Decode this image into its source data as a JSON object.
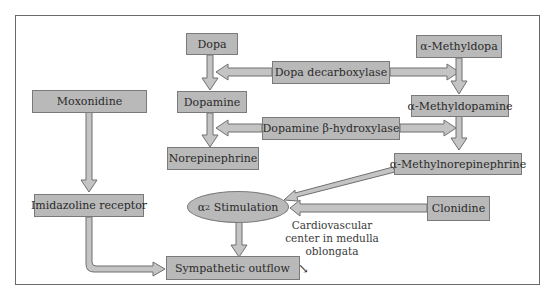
{
  "diagram": {
    "nodes": {
      "dopa": "Dopa",
      "dopamine": "Dopamine",
      "norepinephrine": "Norepinephrine",
      "alpha_methyldopa": "α-Methyldopa",
      "alpha_methyldopamine": "α-Methyldopamine",
      "alpha_methylnorepinephrine": "α-Methylnorepinephrine",
      "dopa_decarboxylase": "Dopa decarboxylase",
      "dopamine_beta_hydroxylase": "Dopamine β-hydroxylase",
      "moxonidine": "Moxonidine",
      "imidazoline_receptor": "Imidazoline receptor",
      "alpha2_stimulation_prefix": "α",
      "alpha2_stimulation_sub": "2",
      "alpha2_stimulation_suffix": " Stimulation",
      "clonidine": "Clonidine",
      "sympathetic_outflow": "Sympathetic outflow",
      "sympathetic_outflow_indicator": "↘"
    },
    "notes": {
      "location_line1": "Cardiovascular",
      "location_line2": "center in medulla",
      "location_line3": "oblongata"
    },
    "colors": {
      "box_fill": "#b9b9b9",
      "box_border": "#7a7a7a",
      "arrow_fill": "#c4c4c4",
      "arrow_stroke": "#6f6f6f",
      "frame": "#6a6a6a"
    }
  }
}
